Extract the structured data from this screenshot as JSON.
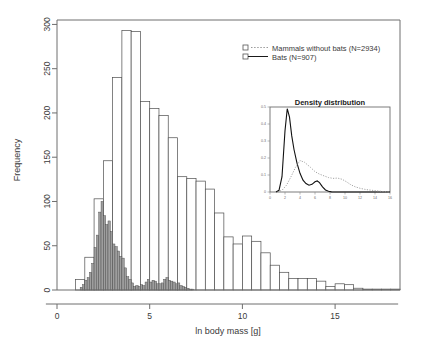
{
  "figure": {
    "background_color": "#ffffff",
    "axis_color": "#6e6e6e",
    "text_color": "#3a3a3a"
  },
  "main_axes": {
    "ylabel": "Frequency",
    "xlabel": "ln body mass [g]",
    "x_ticks": [
      "0",
      "5",
      "10",
      "15"
    ],
    "y_ticks": [
      "0",
      "50",
      "100",
      "150",
      "200",
      "250",
      "300"
    ]
  },
  "legend": {
    "entries": [
      {
        "label": "Mammals without bats (N=2934)",
        "marker": "open-square",
        "line": "dotted",
        "color": "#999999"
      },
      {
        "label": "Bats (N=907)",
        "marker": "open-square",
        "line": "solid",
        "color": "#1a1a1a"
      }
    ]
  },
  "inset": {
    "title": "Density distribution",
    "x_ticks": [
      "0",
      "2",
      "4",
      "6",
      "8",
      "10",
      "12",
      "14",
      "16"
    ],
    "y_ticks": [
      "0",
      "0.1",
      "0.2",
      "0.3",
      "0.4",
      "0.5"
    ]
  },
  "chart_data": {
    "type": "bar",
    "title": "",
    "xlabel": "ln body mass [g]",
    "ylabel": "Frequency",
    "xlim": [
      0,
      18.5
    ],
    "ylim": [
      0,
      305
    ],
    "grid": false,
    "legend_position": "top-right",
    "series": [
      {
        "name": "Mammals without bats (N=2934)",
        "fill": "#ffffff",
        "edge": "#4d4d4d",
        "bin_width": 0.5,
        "bin_starts": [
          1.0,
          1.5,
          2.0,
          2.5,
          3.0,
          3.5,
          4.0,
          4.5,
          5.0,
          5.5,
          6.0,
          6.5,
          7.0,
          7.5,
          8.0,
          8.5,
          9.0,
          9.5,
          10.0,
          10.5,
          11.0,
          11.5,
          12.0,
          12.5,
          13.0,
          13.5,
          14.0,
          14.5,
          15.0,
          15.5,
          16.0,
          16.5,
          17.0,
          17.5,
          18.0
        ],
        "values": [
          12,
          37,
          103,
          146,
          240,
          293,
          292,
          213,
          205,
          197,
          172,
          128,
          126,
          123,
          114,
          87,
          60,
          52,
          61,
          55,
          42,
          28,
          20,
          13,
          13,
          13,
          10,
          4,
          7,
          6,
          2,
          1,
          1,
          1,
          1
        ]
      },
      {
        "name": "Bats (N=907)",
        "fill": "#9e9e9e",
        "edge": "#4d4d4d",
        "bin_width": 0.125,
        "bin_starts": [
          1.25,
          1.375,
          1.5,
          1.625,
          1.75,
          1.875,
          2.0,
          2.125,
          2.25,
          2.375,
          2.5,
          2.625,
          2.75,
          2.875,
          3.0,
          3.125,
          3.25,
          3.375,
          3.5,
          3.625,
          3.75,
          3.875,
          4.0,
          4.125,
          4.25,
          4.375,
          4.5,
          4.625,
          4.75,
          4.875,
          5.0,
          5.125,
          5.25,
          5.375,
          5.5,
          5.625,
          5.75,
          5.875,
          6.0,
          6.125,
          6.25,
          6.375,
          6.5,
          6.625,
          6.75,
          6.875,
          7.0,
          7.125,
          7.25
        ],
        "values": [
          3,
          6,
          11,
          14,
          20,
          30,
          48,
          62,
          88,
          100,
          84,
          74,
          78,
          66,
          52,
          49,
          44,
          38,
          36,
          25,
          15,
          12,
          8,
          4,
          5,
          4,
          6,
          5,
          9,
          12,
          9,
          11,
          10,
          7,
          7,
          8,
          12,
          14,
          11,
          10,
          9,
          7,
          8,
          5,
          4,
          3,
          2,
          1,
          1
        ]
      }
    ],
    "inset_chart": {
      "type": "line",
      "title": "Density distribution",
      "xlim": [
        0,
        16
      ],
      "ylim": [
        0,
        0.5
      ],
      "x_ticks": [
        0,
        2,
        4,
        6,
        8,
        10,
        12,
        14,
        16
      ],
      "y_ticks": [
        0,
        0.1,
        0.2,
        0.3,
        0.4,
        0.5
      ],
      "series": [
        {
          "name": "Bats (N=907)",
          "style": "solid",
          "color": "#111111",
          "x": [
            0.8,
            1.2,
            1.6,
            2.0,
            2.3,
            2.6,
            2.9,
            3.2,
            3.6,
            4.0,
            4.4,
            4.8,
            5.2,
            5.6,
            6.0,
            6.3,
            6.6,
            7.0,
            7.4,
            7.8,
            8.2,
            9.0,
            10.0,
            12.0,
            14.0,
            16.0
          ],
          "y": [
            0.0,
            0.01,
            0.09,
            0.36,
            0.49,
            0.44,
            0.33,
            0.25,
            0.17,
            0.11,
            0.07,
            0.05,
            0.04,
            0.045,
            0.06,
            0.065,
            0.055,
            0.03,
            0.012,
            0.004,
            0.001,
            0.0,
            0.0,
            0.0,
            0.0,
            0.0
          ]
        },
        {
          "name": "Mammals without bats (N=2934)",
          "style": "dotted",
          "color": "#9a9a9a",
          "x": [
            1.0,
            1.6,
            2.2,
            2.8,
            3.4,
            4.0,
            4.6,
            5.0,
            5.4,
            6.0,
            6.6,
            7.2,
            7.8,
            8.4,
            9.0,
            9.6,
            10.2,
            10.8,
            11.4,
            12.0,
            12.6,
            13.2,
            13.8,
            14.4,
            15.0,
            15.6,
            16.0
          ],
          "y": [
            0.0,
            0.01,
            0.04,
            0.09,
            0.145,
            0.185,
            0.175,
            0.16,
            0.145,
            0.12,
            0.105,
            0.095,
            0.085,
            0.08,
            0.082,
            0.075,
            0.06,
            0.042,
            0.03,
            0.022,
            0.016,
            0.012,
            0.009,
            0.006,
            0.003,
            0.001,
            0.0
          ]
        }
      ]
    }
  }
}
